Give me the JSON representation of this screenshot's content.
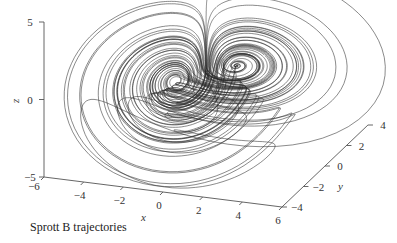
{
  "chart_data": {
    "type": "line",
    "title": "",
    "caption": "Sprott B trajectories",
    "projection": "3d",
    "system": {
      "name": "Sprott B",
      "equations": [
        "dx/dt = y*z",
        "dy/dt = x - y",
        "dz/dt = 1 - x*y"
      ],
      "initial_condition": [
        0.05,
        0.05,
        0.05
      ],
      "t_end": 600,
      "dt": 0.01
    },
    "series": [
      {
        "name": "trajectory",
        "color": "#2a2a2a"
      }
    ],
    "axes": {
      "x": {
        "label": "x",
        "lim": [
          -6,
          6
        ],
        "ticks": [
          -6,
          -4,
          -2,
          0,
          2,
          4,
          6
        ],
        "tick_labels": [
          "−6",
          "−4",
          "−2",
          "0",
          "2",
          "4",
          "6"
        ]
      },
      "y": {
        "label": "y",
        "lim": [
          -4,
          4
        ],
        "ticks": [
          -4,
          -2,
          0,
          2,
          4
        ],
        "tick_labels": [
          "−4",
          "−2",
          "0",
          "2",
          "4"
        ]
      },
      "z": {
        "label": "z",
        "lim": [
          -5,
          5
        ],
        "ticks": [
          -5,
          0,
          5
        ],
        "tick_labels": [
          "−5",
          "0",
          "5"
        ]
      }
    },
    "grid": false,
    "legend": "none"
  }
}
